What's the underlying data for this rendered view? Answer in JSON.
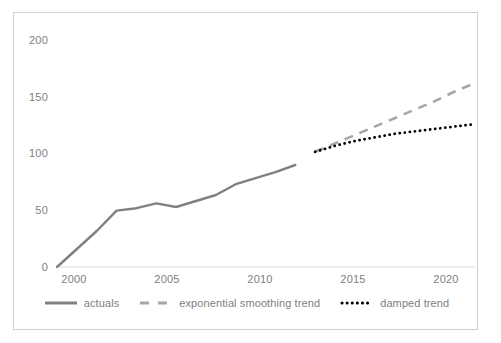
{
  "chart_data": {
    "type": "line",
    "title": "",
    "subtitle": "",
    "xlabel": "",
    "ylabel": "",
    "xlim": [
      2000,
      2021
    ],
    "ylim": [
      0,
      200
    ],
    "grid": false,
    "legend_position": "bottom",
    "x_ticks": [
      "2000",
      "2005",
      "2010",
      "2015",
      "2020"
    ],
    "y_ticks": [
      "0",
      "50",
      "100",
      "150",
      "200"
    ],
    "series": [
      {
        "name": "actuals",
        "style": "solid",
        "color": "#808080",
        "x": [
          2000,
          2001,
          2002,
          2003,
          2004,
          2005,
          2006,
          2007,
          2008,
          2009,
          2010,
          2011,
          2012
        ],
        "values": [
          0,
          15,
          30,
          47,
          49,
          53,
          50,
          55,
          60,
          69,
          74,
          79,
          85
        ]
      },
      {
        "name": "exponential smoothing trend",
        "style": "dashed",
        "color": "#a6a6a6",
        "x": [
          2013,
          2014,
          2015,
          2016,
          2017,
          2018,
          2019,
          2020,
          2021
        ],
        "values": [
          96,
          103,
          110,
          117,
          124,
          131,
          138,
          146,
          153
        ]
      },
      {
        "name": "damped trend",
        "style": "dotted",
        "color": "#000000",
        "x": [
          2013,
          2014,
          2015,
          2016,
          2017,
          2018,
          2019,
          2020,
          2021
        ],
        "values": [
          96,
          101,
          105,
          108,
          111,
          113,
          115,
          117,
          119
        ]
      }
    ]
  },
  "axes": {
    "y_ticks": [
      {
        "label": "200",
        "value": 200
      },
      {
        "label": "150",
        "value": 150
      },
      {
        "label": "100",
        "value": 100
      },
      {
        "label": "50",
        "value": 50
      },
      {
        "label": "0",
        "value": 0
      }
    ],
    "x_ticks": [
      {
        "label": "2000",
        "value": 2000
      },
      {
        "label": "2005",
        "value": 2005
      },
      {
        "label": "2010",
        "value": 2010
      },
      {
        "label": "2015",
        "value": 2015
      },
      {
        "label": "2020",
        "value": 2020
      }
    ]
  },
  "legend": {
    "items": [
      {
        "label": "actuals",
        "style": "solid",
        "color": "#808080",
        "icon": "solid-line-icon"
      },
      {
        "label": "exponential smoothing trend",
        "style": "dashed",
        "color": "#a6a6a6",
        "icon": "dashed-line-icon"
      },
      {
        "label": "damped trend",
        "style": "dotted",
        "color": "#000000",
        "icon": "dotted-line-icon"
      }
    ]
  },
  "colors": {
    "actuals": "#808080",
    "exponential_smoothing_trend": "#a6a6a6",
    "damped_trend": "#000000",
    "axis_text": "#808080",
    "baseline": "#d9d9d9",
    "border": "#d0d0d0",
    "background": "#ffffff"
  }
}
